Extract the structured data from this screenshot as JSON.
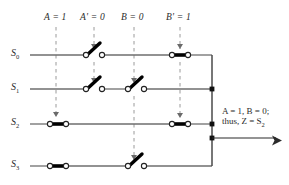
{
  "figure": {
    "title": "Switch network implementing a 4-to-1 multiplexer with control variables A and B",
    "columns": [
      {
        "id": "A",
        "label": "A = 1",
        "x": 56,
        "arrow_row": 2
      },
      {
        "id": "Aprime",
        "label": "A' = 0",
        "x": 94,
        "arrow_row": 1
      },
      {
        "id": "B",
        "label": "B = 0",
        "x": 134,
        "arrow_row": 3
      },
      {
        "id": "Bprime",
        "label": "B' = 1",
        "x": 180,
        "arrow_row": 2
      }
    ],
    "rows": [
      {
        "id": "S0",
        "label": "S",
        "sub": "0",
        "y": 55,
        "switches": [
          {
            "col": "Aprime",
            "state": "open"
          },
          {
            "col": "Bprime",
            "state": "closed"
          }
        ]
      },
      {
        "id": "S1",
        "label": "S",
        "sub": "1",
        "y": 89,
        "switches": [
          {
            "col": "Aprime",
            "state": "open"
          },
          {
            "col": "B",
            "state": "open"
          }
        ]
      },
      {
        "id": "S2",
        "label": "S",
        "sub": "2",
        "y": 124,
        "switches": [
          {
            "col": "A",
            "state": "closed"
          },
          {
            "col": "Bprime",
            "state": "closed"
          }
        ]
      },
      {
        "id": "S3",
        "label": "S",
        "sub": "3",
        "y": 166,
        "switches": [
          {
            "col": "A",
            "state": "closed"
          },
          {
            "col": "B",
            "state": "open"
          }
        ]
      }
    ],
    "output_bus": {
      "x": 212,
      "top": 55,
      "bottom": 166
    },
    "output_arrow": {
      "y": 138,
      "x_start": 212,
      "x_end": 281
    },
    "annotation": {
      "line1_pre": "A",
      "line1": "A = 1, B = 0;",
      "line2": "thus, Z = S",
      "line2_sub": "2",
      "x": 222,
      "y": 113
    },
    "colors": {
      "wire": "#6e6e6e",
      "bus": "#4a4a4a",
      "switch_lever": "#000000",
      "dashed": "#9a9a9a",
      "text": "#2b2b2b",
      "background": "#ffffff"
    }
  }
}
